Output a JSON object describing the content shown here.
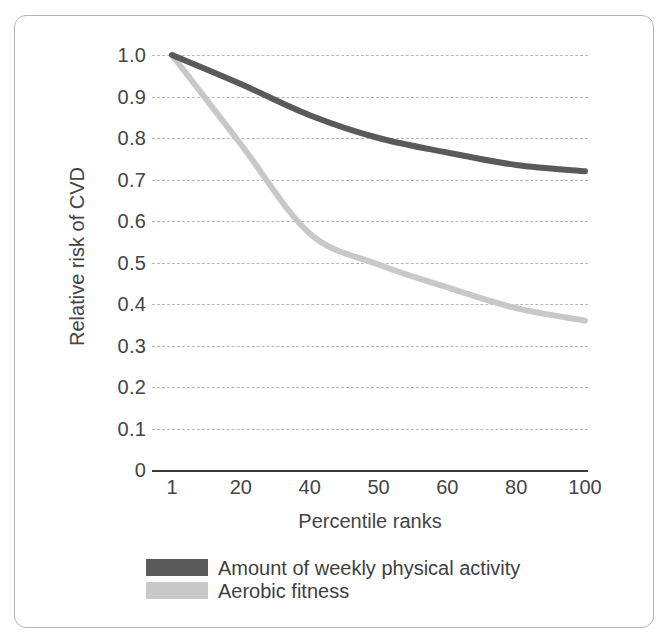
{
  "chart_data": {
    "type": "line",
    "title": "",
    "xlabel": "Percentile ranks",
    "ylabel": "Relative risk of CVD",
    "x_tick_labels": [
      "1",
      "20",
      "40",
      "50",
      "60",
      "80",
      "100"
    ],
    "x_spacing": "categorical-even",
    "y_tick_labels": [
      "1.0",
      "0.9",
      "0.8",
      "0.7",
      "0.6",
      "0.5",
      "0.4",
      "0.3",
      "0.2",
      "0.1",
      "0"
    ],
    "ylim": [
      0,
      1.0
    ],
    "grid": "horizontal-dashed",
    "legend_position": "below-axis-left",
    "categories": [
      1,
      20,
      40,
      50,
      60,
      80,
      100
    ],
    "series": [
      {
        "name": "Amount of weekly physical activity",
        "color": "#5a5a5a",
        "values": [
          1.0,
          0.93,
          0.855,
          0.8,
          0.765,
          0.735,
          0.72
        ]
      },
      {
        "name": "Aerobic fitness",
        "color": "#c8c8c8",
        "values": [
          1.0,
          0.785,
          0.57,
          0.495,
          0.44,
          0.39,
          0.36
        ]
      }
    ]
  },
  "legend": {
    "items": [
      {
        "label": "Amount of weekly physical activity",
        "color": "#5a5a5a"
      },
      {
        "label": "Aerobic fitness",
        "color": "#c8c8c8"
      }
    ]
  },
  "axes": {
    "x_title": "Percentile ranks",
    "y_title": "Relative risk of CVD",
    "y_ticks": [
      "1.0",
      "0.9",
      "0.8",
      "0.7",
      "0.6",
      "0.5",
      "0.4",
      "0.3",
      "0.2",
      "0.1",
      "0"
    ],
    "x_ticks": [
      "1",
      "20",
      "40",
      "50",
      "60",
      "80",
      "100"
    ]
  },
  "colors": {
    "series_dark": "#5a5a5a",
    "series_light": "#c8c8c8",
    "gridline": "#b8b8b8",
    "axis": "#3a3a3a",
    "frame": "#b4b4b4",
    "text": "#444444",
    "background": "#ffffff"
  }
}
